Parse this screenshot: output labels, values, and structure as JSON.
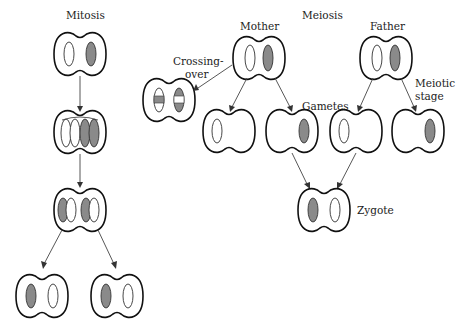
{
  "labels": {
    "mitosis": "Mitosis",
    "meiosis": "Meiosis",
    "mother": "Mother",
    "father": "Father",
    "crossing_over_line1": "Crossing-",
    "crossing_over_line2": "over",
    "gametes": "Gametes",
    "meiotic_stage_line1": "Meiotic",
    "meiotic_stage_line2": "stage",
    "zygote": "Zygote"
  },
  "colors": {
    "filled_chromosome": "#8a8a8a",
    "outline": "#111111",
    "background": "#ffffff"
  }
}
